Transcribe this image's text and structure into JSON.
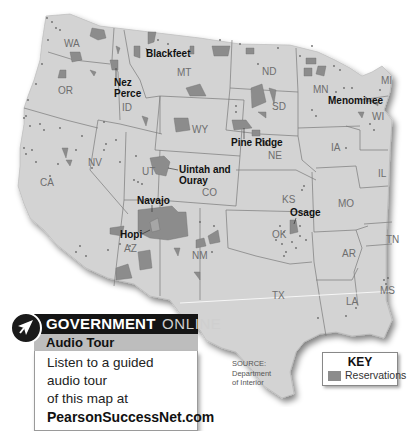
{
  "map": {
    "title": "Native American Reservations in the Continental United States",
    "colors": {
      "land": "#d3d3d3",
      "border": "#7a7a7a",
      "reservation": "#8c8c8c",
      "water": "#ffffff"
    },
    "states": [
      {
        "abbr": "WA",
        "x": 73,
        "y": 44
      },
      {
        "abbr": "OR",
        "x": 64,
        "y": 90
      },
      {
        "abbr": "ID",
        "x": 127,
        "y": 107
      },
      {
        "abbr": "MT",
        "x": 182,
        "y": 72
      },
      {
        "abbr": "WY",
        "x": 193,
        "y": 128
      },
      {
        "abbr": "ND",
        "x": 262,
        "y": 72
      },
      {
        "abbr": "SD",
        "x": 272,
        "y": 107
      },
      {
        "abbr": "NE",
        "x": 272,
        "y": 156
      },
      {
        "abbr": "MN",
        "x": 320,
        "y": 90
      },
      {
        "abbr": "WI",
        "x": 376,
        "y": 117
      },
      {
        "abbr": "MI",
        "x": 383,
        "y": 82
      },
      {
        "abbr": "IA",
        "x": 334,
        "y": 148
      },
      {
        "abbr": "IL",
        "x": 380,
        "y": 174
      },
      {
        "abbr": "NV",
        "x": 94,
        "y": 162
      },
      {
        "abbr": "CA",
        "x": 45,
        "y": 183
      },
      {
        "abbr": "UT",
        "x": 146,
        "y:": 172,
        "y": 172
      },
      {
        "abbr": "CO",
        "x": 207,
        "y": 193
      },
      {
        "abbr": "KS",
        "x": 286,
        "y": 200
      },
      {
        "abbr": "MO",
        "x": 342,
        "y": 204
      },
      {
        "abbr": "AZ",
        "x": 129,
        "y": 248
      },
      {
        "abbr": "NM",
        "x": 197,
        "y": 255
      },
      {
        "abbr": "OK",
        "x": 277,
        "y": 234
      },
      {
        "abbr": "AR",
        "x": 346,
        "y": 254
      },
      {
        "abbr": "TN",
        "x": 390,
        "y": 240
      },
      {
        "abbr": "TX",
        "x": 278,
        "y": 296
      },
      {
        "abbr": "LA",
        "x": 350,
        "y": 302
      },
      {
        "abbr": "MS",
        "x": 384,
        "y": 290
      }
    ],
    "reservation_labels": [
      {
        "name": "Blackfeet",
        "x": 146,
        "y": 56
      },
      {
        "name": "Nez",
        "x": 114,
        "y": 85
      },
      {
        "name": "Perce",
        "x": 114,
        "y": 96
      },
      {
        "name": "Menominee",
        "x": 328,
        "y": 102
      },
      {
        "name": "Pine Ridge",
        "x": 231,
        "y": 145
      },
      {
        "name": "Uintah and",
        "x": 180,
        "y": 172
      },
      {
        "name": "Ouray",
        "x": 180,
        "y": 183
      },
      {
        "name": "Navajo",
        "x": 137,
        "y": 202
      },
      {
        "name": "Hopi",
        "x": 121,
        "y": 237
      },
      {
        "name": "Osage",
        "x": 291,
        "y": 215
      }
    ]
  },
  "government_online": {
    "title_bold": "GOVERNMENT",
    "title_light": "ONLINE",
    "subtitle": "Audio Tour",
    "body_line1": "Listen to a guided audio tour",
    "body_line2": "of this map at",
    "url": "PearsonSuccessNet.com",
    "icon": "arrow-cursor-icon"
  },
  "source": {
    "line1": "SOURCE:",
    "line2": "Department",
    "line3": "of Interior"
  },
  "key": {
    "title": "KEY",
    "items": [
      {
        "label": "Reservations",
        "color": "#8c8c8c"
      }
    ]
  }
}
